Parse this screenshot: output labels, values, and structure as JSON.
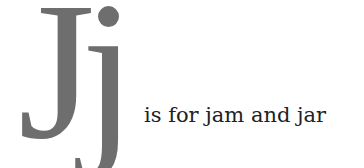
{
  "letter": {
    "glyphs": "Jj",
    "color": "#6e6e6e"
  },
  "caption": {
    "text": "is for jam and jar",
    "color": "#222222"
  }
}
